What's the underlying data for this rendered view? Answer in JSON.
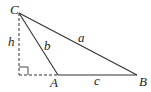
{
  "diagram": {
    "type": "triangle-with-altitude",
    "vertices": {
      "C": {
        "label": "C",
        "x": 19,
        "y": 13
      },
      "A": {
        "label": "A",
        "x": 58,
        "y": 75
      },
      "B": {
        "label": "B",
        "x": 137,
        "y": 75
      },
      "foot": {
        "x": 19,
        "y": 75
      }
    },
    "sides": {
      "a": {
        "label": "a",
        "from": "C",
        "to": "B"
      },
      "b": {
        "label": "b",
        "from": "C",
        "to": "A"
      },
      "c": {
        "label": "c",
        "from": "A",
        "to": "B"
      }
    },
    "altitude": {
      "label": "h",
      "style": "dashed"
    },
    "right_angle_marker": true,
    "colors": {
      "stroke": "#333333",
      "background": "#ffffff"
    }
  }
}
